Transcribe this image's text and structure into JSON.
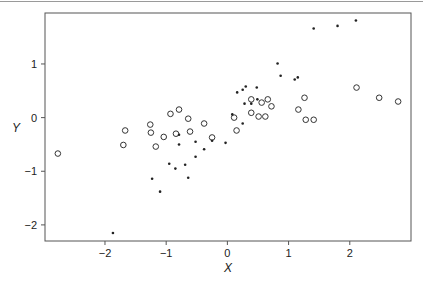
{
  "chart_data": {
    "type": "scatter",
    "title": "",
    "xlabel": "X",
    "ylabel": "Y",
    "xlim": [
      -2.98,
      3.0
    ],
    "ylim": [
      -2.3,
      1.95
    ],
    "xticks": [
      -2,
      -1,
      0,
      1,
      2
    ],
    "yticks": [
      -2,
      -1,
      0,
      1
    ],
    "xtick_labels": [
      "−2",
      "−1",
      "0",
      "1",
      "2"
    ],
    "ytick_labels": [
      "−2",
      "−1",
      "0",
      "1"
    ],
    "grid": false,
    "legend": null,
    "series": [
      {
        "name": "open circles",
        "marker": "circle-open",
        "color": "#333333",
        "points": [
          [
            -2.77,
            -0.67
          ],
          [
            -1.67,
            -0.24
          ],
          [
            -1.7,
            -0.51
          ],
          [
            -1.26,
            -0.13
          ],
          [
            -1.25,
            -0.28
          ],
          [
            -1.17,
            -0.54
          ],
          [
            -1.04,
            -0.36
          ],
          [
            -0.93,
            0.07
          ],
          [
            -0.79,
            0.15
          ],
          [
            -0.84,
            -0.3
          ],
          [
            -0.64,
            -0.02
          ],
          [
            -0.61,
            -0.26
          ],
          [
            -0.38,
            -0.11
          ],
          [
            -0.25,
            -0.37
          ],
          [
            0.11,
            0.0
          ],
          [
            0.15,
            -0.24
          ],
          [
            0.39,
            0.34
          ],
          [
            0.56,
            0.28
          ],
          [
            0.66,
            0.34
          ],
          [
            0.72,
            0.21
          ],
          [
            0.39,
            0.09
          ],
          [
            0.51,
            0.02
          ],
          [
            0.62,
            0.02
          ],
          [
            1.26,
            0.37
          ],
          [
            1.16,
            0.15
          ],
          [
            1.28,
            -0.04
          ],
          [
            1.41,
            -0.04
          ],
          [
            2.11,
            0.56
          ],
          [
            2.48,
            0.37
          ],
          [
            2.79,
            0.3
          ]
        ]
      },
      {
        "name": "filled dots",
        "marker": "dot",
        "color": "#222222",
        "points": [
          [
            -1.87,
            -2.15
          ],
          [
            -1.23,
            -1.14
          ],
          [
            -1.1,
            -1.38
          ],
          [
            -0.95,
            -0.86
          ],
          [
            -0.85,
            -0.95
          ],
          [
            -0.79,
            -0.32
          ],
          [
            -0.69,
            -0.88
          ],
          [
            -0.64,
            -1.12
          ],
          [
            -0.52,
            -0.73
          ],
          [
            -0.38,
            -0.59
          ],
          [
            -0.25,
            -0.43
          ],
          [
            -0.79,
            -0.5
          ],
          [
            -0.52,
            -0.45
          ],
          [
            -0.03,
            -0.47
          ],
          [
            0.08,
            0.06
          ],
          [
            0.16,
            0.47
          ],
          [
            0.25,
            0.52
          ],
          [
            0.3,
            0.58
          ],
          [
            0.48,
            0.56
          ],
          [
            0.28,
            0.26
          ],
          [
            0.39,
            0.26
          ],
          [
            0.49,
            0.34
          ],
          [
            0.25,
            -0.11
          ],
          [
            0.82,
            1.01
          ],
          [
            0.87,
            0.78
          ],
          [
            1.1,
            0.71
          ],
          [
            1.15,
            0.75
          ],
          [
            1.41,
            1.66
          ],
          [
            1.8,
            1.71
          ],
          [
            2.1,
            1.81
          ]
        ]
      }
    ]
  },
  "axes": {
    "x_label": "X",
    "y_label": "Y"
  }
}
